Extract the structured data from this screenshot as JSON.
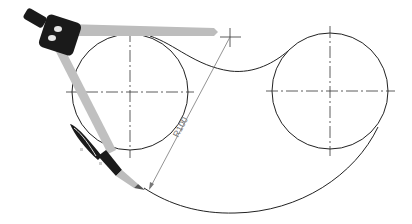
{
  "diagram": {
    "dimension_label": "R100",
    "colors": {
      "line": "#222222",
      "center_line": "#333333",
      "dimension": "#777777",
      "compass_arm": "#bdbdbd",
      "compass_head": "#1a1a1a"
    },
    "elements": {
      "left_circle": {
        "cx": 130,
        "cy": 92,
        "r": 58
      },
      "right_circle": {
        "cx": 330,
        "cy": 91,
        "r": 58
      },
      "arc_center_mark": {
        "x": 230,
        "y": 37
      }
    }
  }
}
